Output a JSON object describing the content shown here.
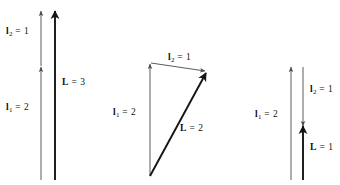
{
  "figure": {
    "background_color": "#ffffff",
    "stroke_color": "#1a1a1a",
    "thin_stroke_color": "#4a4a4a",
    "panels": [
      {
        "id": "panel-parallel",
        "description": "Two parallel vectors in the same direction; resultant is the sum",
        "labels": {
          "l2": {
            "symbol": "l",
            "subscript": "2",
            "equals": "=",
            "value": "1",
            "text": "l2 = 1"
          },
          "l1": {
            "symbol": "l",
            "subscript": "1",
            "equals": "=",
            "value": "2",
            "text": "l1 = 2"
          },
          "L": {
            "symbol": "L",
            "subscript": "",
            "equals": "=",
            "value": "3",
            "text": "L = 3"
          }
        }
      },
      {
        "id": "panel-triangle",
        "description": "Two vectors at an angle forming a triangle; resultant closes the triangle",
        "labels": {
          "l2": {
            "symbol": "l",
            "subscript": "2",
            "equals": "=",
            "value": "1",
            "text": "l2 = 1"
          },
          "l1": {
            "symbol": "l",
            "subscript": "1",
            "equals": "=",
            "value": "2",
            "text": "l1 = 2"
          },
          "L": {
            "symbol": "L",
            "subscript": "",
            "equals": "=",
            "value": "2",
            "text": "L = 2"
          }
        }
      },
      {
        "id": "panel-antiparallel",
        "description": "Two antiparallel vectors; resultant is the difference",
        "labels": {
          "l2": {
            "symbol": "l",
            "subscript": "2",
            "equals": "=",
            "value": "1",
            "text": "l2 = 1"
          },
          "l1": {
            "symbol": "l",
            "subscript": "1",
            "equals": "=",
            "value": "2",
            "text": "l1 = 2"
          },
          "L": {
            "symbol": "L",
            "subscript": "",
            "equals": "=",
            "value": "1",
            "text": "L = 1"
          }
        }
      }
    ]
  }
}
